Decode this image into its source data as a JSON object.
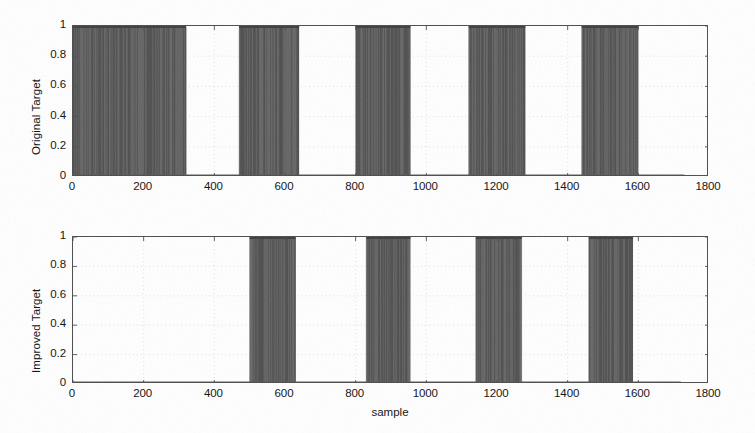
{
  "figure": {
    "background_color": "#ffffff",
    "trace_color": "#5a5a5a",
    "axis_color": "#4d4d4d",
    "grid_color": "#d8d8d8"
  },
  "chart_data": [
    {
      "type": "line",
      "title": "",
      "xlabel": "",
      "ylabel": "Original Target",
      "xlim": [
        0,
        1800
      ],
      "ylim": [
        0,
        1
      ],
      "xticks": [
        0,
        200,
        400,
        600,
        800,
        1000,
        1200,
        1400,
        1600,
        1800
      ],
      "xticklabels": [
        "0",
        "200",
        "400",
        "600",
        "800",
        "1000",
        "1200",
        "1400",
        "1600",
        "1800"
      ],
      "yticks": [
        0,
        0.2,
        0.4,
        0.6,
        0.8,
        1
      ],
      "yticklabels": [
        "0",
        "0.2",
        "0.4",
        "0.6",
        "0.8",
        "1"
      ],
      "grid": true,
      "legend": "none",
      "description": "Binary square-wave target signal alternating between 0 and 1",
      "data_end_x": 1730,
      "pulses": [
        {
          "start": 0,
          "end": 320,
          "value": 1
        },
        {
          "start": 470,
          "end": 640,
          "value": 1
        },
        {
          "start": 800,
          "end": 955,
          "value": 1
        },
        {
          "start": 1120,
          "end": 1280,
          "value": 1
        },
        {
          "start": 1440,
          "end": 1600,
          "value": 1
        }
      ]
    },
    {
      "type": "line",
      "title": "",
      "xlabel": "sample",
      "ylabel": "Improved Target",
      "xlim": [
        0,
        1800
      ],
      "ylim": [
        0,
        1
      ],
      "xticks": [
        0,
        200,
        400,
        600,
        800,
        1000,
        1200,
        1400,
        1600,
        1800
      ],
      "xticklabels": [
        "0",
        "200",
        "400",
        "600",
        "800",
        "1000",
        "1200",
        "1400",
        "1600",
        "1800"
      ],
      "yticks": [
        0,
        0.2,
        0.4,
        0.6,
        0.8,
        1
      ],
      "yticklabels": [
        "0",
        "0.2",
        "0.4",
        "0.6",
        "0.8",
        "1"
      ],
      "grid": true,
      "legend": "none",
      "description": "Binary square-wave improved target signal alternating between 0 and 1",
      "data_end_x": 1720,
      "pulses": [
        {
          "start": 500,
          "end": 630,
          "value": 1
        },
        {
          "start": 830,
          "end": 955,
          "value": 1
        },
        {
          "start": 1140,
          "end": 1270,
          "value": 1
        },
        {
          "start": 1460,
          "end": 1585,
          "value": 1
        }
      ]
    }
  ]
}
